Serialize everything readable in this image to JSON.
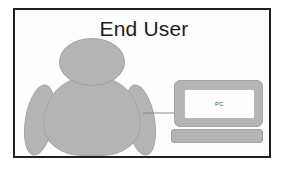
{
  "diagram": {
    "title": "End User",
    "border_color": "#231f20",
    "background_color": "#ffffff",
    "shape_fill_color": "#b4b4b4",
    "shape_outline_color": "#a4a4a4",
    "nodes": [
      {
        "id": "end-user-person",
        "kind": "person-clipart",
        "label": "",
        "parts": [
          "head",
          "torso",
          "left-arm",
          "right-arm"
        ]
      },
      {
        "id": "pc-workstation",
        "kind": "computer",
        "screen_label": "PC",
        "parts": [
          "monitor",
          "screen",
          "keyboard"
        ]
      }
    ],
    "connectors": [
      {
        "id": "person-to-pc",
        "from": "end-user-person",
        "to": "pc-workstation",
        "style": "solid-thin",
        "direction": "right",
        "color": "#8c8c8c",
        "label": ""
      }
    ]
  }
}
